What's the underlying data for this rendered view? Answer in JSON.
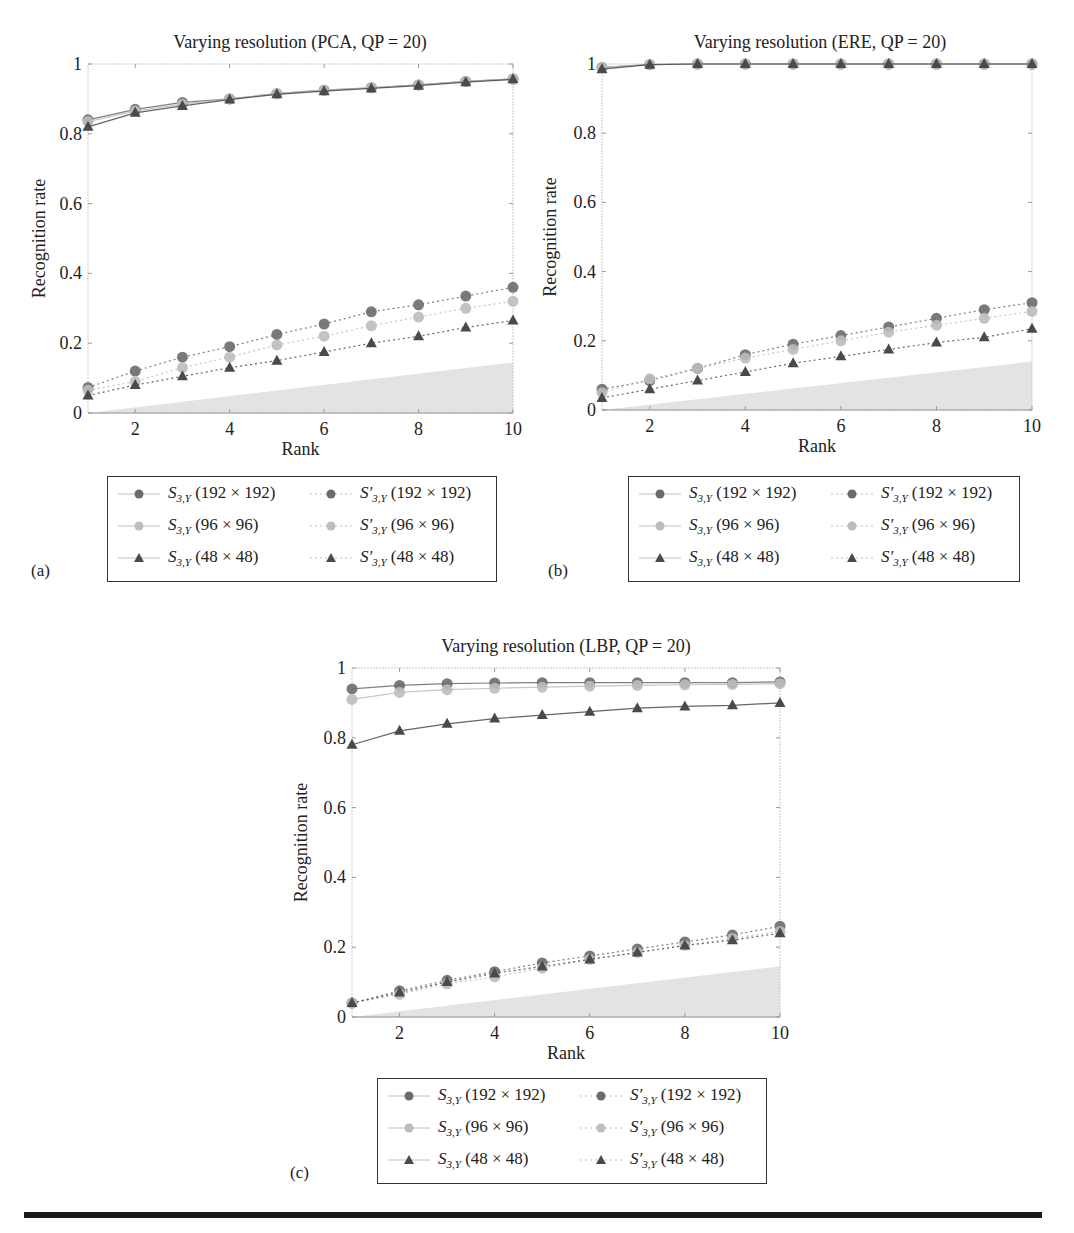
{
  "figure": {
    "panels": [
      {
        "tag": "(a)",
        "title": "Varying resolution (PCA, QP = 20)"
      },
      {
        "tag": "(b)",
        "title": "Varying resolution (ERE, QP = 20)"
      },
      {
        "tag": "(c)",
        "title": "Varying resolution (LBP, QP = 20)"
      }
    ],
    "legend_entries": [
      {
        "base": "S",
        "sub": "3,Y",
        "prime": false,
        "res": "(192 × 192)",
        "marker": "circle",
        "color": "#6b6b6b",
        "line": "solid"
      },
      {
        "base": "S",
        "sub": "3,Y",
        "prime": true,
        "res": "(192 × 192)",
        "marker": "circle",
        "color": "#6b6b6b",
        "line": "dotted"
      },
      {
        "base": "S",
        "sub": "3,Y",
        "prime": false,
        "res": "(96 × 96)",
        "marker": "circle",
        "color": "#bdbdbd",
        "line": "solid"
      },
      {
        "base": "S",
        "sub": "3,Y",
        "prime": true,
        "res": "(96 × 96)",
        "marker": "circle",
        "color": "#bdbdbd",
        "line": "dotted"
      },
      {
        "base": "S",
        "sub": "3,Y",
        "prime": false,
        "res": "(48 × 48)",
        "marker": "triangle",
        "color": "#4a4a4a",
        "line": "solid"
      },
      {
        "base": "S",
        "sub": "3,Y",
        "prime": true,
        "res": "(48 × 48)",
        "marker": "triangle",
        "color": "#4a4a4a",
        "line": "dotted"
      }
    ]
  },
  "chart_data": [
    {
      "type": "line",
      "title": "Varying resolution (PCA, QP = 20)",
      "xlabel": "Rank",
      "ylabel": "Recognition rate",
      "x": [
        1,
        2,
        3,
        4,
        5,
        6,
        7,
        8,
        9,
        10
      ],
      "xticks": [
        2,
        4,
        6,
        8,
        10
      ],
      "yticks": [
        0,
        0.2,
        0.4,
        0.6,
        0.8,
        1
      ],
      "xlim": [
        1,
        10
      ],
      "ylim": [
        0,
        1
      ],
      "grid": false,
      "legend_position": "below",
      "shaded_region": {
        "description": "gray baseline area",
        "x": [
          1,
          10
        ],
        "y_top": [
          0.0,
          0.145
        ]
      },
      "series": [
        {
          "name": "S3,Y (192×192)",
          "values": [
            0.84,
            0.87,
            0.89,
            0.9,
            0.915,
            0.925,
            0.932,
            0.94,
            0.95,
            0.957
          ]
        },
        {
          "name": "S'3,Y (192×192)",
          "values": [
            0.073,
            0.12,
            0.16,
            0.19,
            0.225,
            0.255,
            0.29,
            0.31,
            0.335,
            0.36
          ]
        },
        {
          "name": "S3,Y (96×96)",
          "values": [
            0.835,
            0.865,
            0.885,
            0.9,
            0.915,
            0.925,
            0.932,
            0.94,
            0.95,
            0.957
          ]
        },
        {
          "name": "S'3,Y (96×96)",
          "values": [
            0.065,
            0.09,
            0.13,
            0.16,
            0.195,
            0.22,
            0.25,
            0.275,
            0.3,
            0.32
          ]
        },
        {
          "name": "S3,Y (48×48)",
          "values": [
            0.82,
            0.86,
            0.88,
            0.898,
            0.913,
            0.922,
            0.93,
            0.938,
            0.948,
            0.956
          ]
        },
        {
          "name": "S'3,Y (48×48)",
          "values": [
            0.05,
            0.08,
            0.105,
            0.13,
            0.15,
            0.175,
            0.2,
            0.22,
            0.245,
            0.265
          ]
        }
      ]
    },
    {
      "type": "line",
      "title": "Varying resolution (ERE, QP = 20)",
      "xlabel": "Rank",
      "ylabel": "Recognition rate",
      "x": [
        1,
        2,
        3,
        4,
        5,
        6,
        7,
        8,
        9,
        10
      ],
      "xticks": [
        2,
        4,
        6,
        8,
        10
      ],
      "yticks": [
        0,
        0.2,
        0.4,
        0.6,
        0.8,
        1
      ],
      "xlim": [
        1,
        10
      ],
      "ylim": [
        0,
        1
      ],
      "grid": false,
      "legend_position": "below",
      "shaded_region": {
        "description": "gray baseline area",
        "x": [
          1,
          10
        ],
        "y_top": [
          0.0,
          0.14
        ]
      },
      "series": [
        {
          "name": "S3,Y (192×192)",
          "values": [
            0.99,
            0.998,
            1.0,
            1.0,
            1.0,
            1.0,
            1.0,
            1.0,
            1.0,
            1.0
          ]
        },
        {
          "name": "S'3,Y (192×192)",
          "values": [
            0.06,
            0.085,
            0.12,
            0.16,
            0.19,
            0.215,
            0.24,
            0.265,
            0.29,
            0.31
          ]
        },
        {
          "name": "S3,Y (96×96)",
          "values": [
            0.99,
            0.998,
            1.0,
            1.0,
            1.0,
            1.0,
            1.0,
            1.0,
            1.0,
            1.0
          ]
        },
        {
          "name": "S'3,Y (96×96)",
          "values": [
            0.05,
            0.09,
            0.12,
            0.15,
            0.175,
            0.2,
            0.225,
            0.245,
            0.265,
            0.285
          ]
        },
        {
          "name": "S3,Y (48×48)",
          "values": [
            0.985,
            0.998,
            1.0,
            1.0,
            1.0,
            1.0,
            1.0,
            1.0,
            1.0,
            1.0
          ]
        },
        {
          "name": "S'3,Y (48×48)",
          "values": [
            0.035,
            0.06,
            0.085,
            0.11,
            0.135,
            0.155,
            0.175,
            0.195,
            0.21,
            0.235
          ]
        }
      ]
    },
    {
      "type": "line",
      "title": "Varying resolution (LBP, QP = 20)",
      "xlabel": "Rank",
      "ylabel": "Recognition rate",
      "x": [
        1,
        2,
        3,
        4,
        5,
        6,
        7,
        8,
        9,
        10
      ],
      "xticks": [
        2,
        4,
        6,
        8,
        10
      ],
      "yticks": [
        0,
        0.2,
        0.4,
        0.6,
        0.8,
        1
      ],
      "xlim": [
        1,
        10
      ],
      "ylim": [
        0,
        1
      ],
      "grid": false,
      "legend_position": "below",
      "shaded_region": {
        "description": "gray baseline area",
        "x": [
          1,
          10
        ],
        "y_top": [
          0.0,
          0.145
        ]
      },
      "series": [
        {
          "name": "S3,Y (192×192)",
          "values": [
            0.94,
            0.95,
            0.955,
            0.957,
            0.958,
            0.958,
            0.958,
            0.958,
            0.958,
            0.96
          ]
        },
        {
          "name": "S'3,Y (192×192)",
          "values": [
            0.04,
            0.075,
            0.105,
            0.13,
            0.155,
            0.175,
            0.195,
            0.215,
            0.235,
            0.26
          ]
        },
        {
          "name": "S3,Y (96×96)",
          "values": [
            0.91,
            0.93,
            0.938,
            0.942,
            0.945,
            0.948,
            0.95,
            0.952,
            0.953,
            0.955
          ]
        },
        {
          "name": "S'3,Y (96×96)",
          "values": [
            0.04,
            0.065,
            0.095,
            0.115,
            0.14,
            0.165,
            0.185,
            0.205,
            0.225,
            0.245
          ]
        },
        {
          "name": "S3,Y (48×48)",
          "values": [
            0.78,
            0.82,
            0.84,
            0.855,
            0.865,
            0.875,
            0.885,
            0.89,
            0.893,
            0.9
          ]
        },
        {
          "name": "S'3,Y (48×48)",
          "values": [
            0.04,
            0.07,
            0.1,
            0.125,
            0.145,
            0.165,
            0.185,
            0.205,
            0.22,
            0.24
          ]
        }
      ]
    }
  ]
}
